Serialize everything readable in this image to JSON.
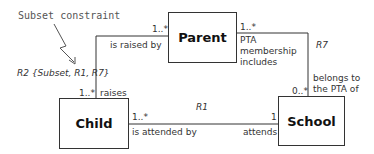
{
  "annotation": {
    "text": "Subset constraint"
  },
  "classes": {
    "parent": {
      "name": "Parent"
    },
    "child": {
      "name": "Child"
    },
    "school": {
      "name": "School"
    }
  },
  "relationships": {
    "r2": {
      "label": "R2 {Subset, R1, R7}",
      "parent_end_multiplicity": "1..*",
      "parent_end_phrase": "is raised by",
      "child_end_multiplicity": "1..*",
      "child_end_phrase": "raises"
    },
    "r1": {
      "label": "R1",
      "child_end_multiplicity": "1..*",
      "child_end_phrase": "is attended by",
      "school_end_multiplicity": "1",
      "school_end_phrase": "attends"
    },
    "r7": {
      "label": "R7",
      "parent_end_multiplicity": "1..*",
      "parent_end_phrase_lines": [
        "PTA",
        "membership",
        "includes"
      ],
      "school_end_multiplicity": "0..*",
      "school_end_phrase_lines": [
        "belongs to",
        "the PTA of"
      ]
    }
  }
}
